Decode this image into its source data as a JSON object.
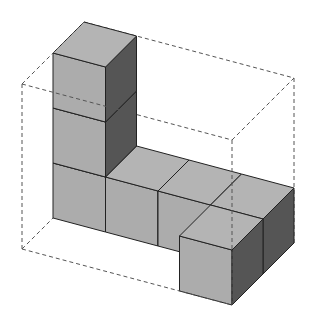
{
  "diagram": {
    "type": "isometric-cube-structure",
    "width": 313,
    "height": 328,
    "projection": {
      "origin": [
        53,
        218
      ],
      "unit_x": [
        52.5,
        14
      ],
      "unit_y": [
        31,
        -31
      ],
      "unit_z": [
        0,
        -55
      ]
    },
    "colors": {
      "top": "#b4b4b4",
      "front": "#acacac",
      "side": "#555555",
      "edge": "#222222",
      "dashed": "#555555",
      "background": "#ffffff"
    },
    "cubes": [
      {
        "i": 0,
        "j": 0,
        "k": 0
      },
      {
        "i": 0,
        "j": 0,
        "k": 1
      },
      {
        "i": 0,
        "j": 0,
        "k": 2
      },
      {
        "i": 1,
        "j": 0,
        "k": 0
      },
      {
        "i": 2,
        "j": 0,
        "k": 0
      },
      {
        "i": 3,
        "j": 0,
        "k": 0
      },
      {
        "i": 3,
        "j": -1,
        "k": 0
      }
    ],
    "bounding_box": {
      "min": [
        0,
        -1,
        0
      ],
      "max": [
        4,
        1,
        3
      ],
      "style": "dashed"
    }
  }
}
